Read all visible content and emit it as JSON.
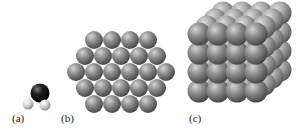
{
  "figure": {
    "panels": [
      {
        "id": "a",
        "label": "(a)",
        "content": "single water molecule (one O atom, two H atoms)"
      },
      {
        "id": "b",
        "label": "(b)",
        "content": "hexagonal close-packed layer of spheres",
        "rows": [
          4,
          5,
          6,
          5,
          4
        ]
      },
      {
        "id": "c",
        "label": "(c)",
        "content": "3D cubic stack of spheres (crystal lattice)"
      }
    ],
    "colors": {
      "oxygen": "#151515",
      "hydrogen": "#d8d8d8",
      "sphere": "#8a8a8a",
      "label": "#222222",
      "background": "#ffffff"
    }
  }
}
